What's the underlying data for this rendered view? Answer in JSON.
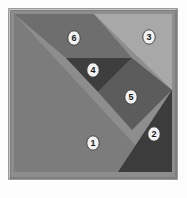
{
  "figure": {
    "kind": "tangram-puzzle",
    "background_color": "#fdfdfd",
    "frame": {
      "border_color": "#9a9a9a",
      "border_highlight_color": "#c8c8c8",
      "border_shadow_color": "#787878",
      "inner_fill": "#8d8d8d"
    },
    "label_marker": {
      "shape": "ellipse",
      "fill_color": "#f2f2f2",
      "stroke_color": "#3a3a3a",
      "text_color": "#1a1a1a"
    },
    "pieces": [
      {
        "id": "piece-1",
        "label": "1",
        "shape": "large-triangle",
        "color": "#7c7c7c",
        "points": "6,6 6,164 152,164",
        "label_x": 85,
        "label_y": 135
      },
      {
        "id": "piece-2",
        "label": "2",
        "shape": "triangle",
        "color": "#3c3c3c",
        "points": "164,82 164,164 110,164",
        "label_x": 146,
        "label_y": 126
      },
      {
        "id": "piece-3",
        "label": "3",
        "shape": "large-triangle",
        "color": "#a8a8a8",
        "points": "86,6 164,6 164,82",
        "label_x": 141,
        "label_y": 29
      },
      {
        "id": "piece-4",
        "label": "4",
        "shape": "small-triangle",
        "color": "#3e3e3e",
        "points": "58,50 124,50 90,84",
        "label_x": 85,
        "label_y": 62
      },
      {
        "id": "piece-5",
        "label": "5",
        "shape": "parallelogram",
        "color": "#5c5c5c",
        "points": "124,50 164,82 124,122 90,84",
        "label_x": 123,
        "label_y": 89
      },
      {
        "id": "piece-6",
        "label": "6",
        "shape": "parallelogram",
        "color": "#6e6e6e",
        "points": "6,6 86,6 124,50 58,50",
        "label_x": 66,
        "label_y": 30
      }
    ]
  }
}
